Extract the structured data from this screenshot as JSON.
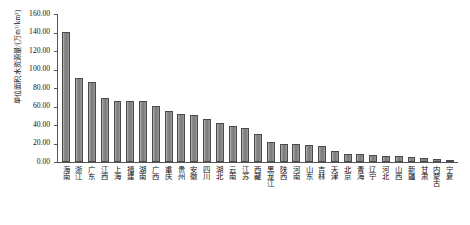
{
  "chart_data": {
    "type": "bar",
    "title": "",
    "xlabel": "",
    "ylabel": "单位面积水资源量/(万m³/km²)",
    "ylim": [
      0,
      160
    ],
    "ytick_step": 20,
    "ytick_labels": [
      "160.00",
      "140.00",
      "120.00",
      "100.00",
      "80.00",
      "60.00",
      "40.00",
      "20.00",
      "0.00"
    ],
    "grid": false,
    "legend": "none",
    "bar_color": "#8c8c8c",
    "bar_edge_color": "#4a4a4a",
    "axis_color": "#555555",
    "categories": [
      "海南",
      "浙江",
      "广东",
      "江西",
      "上海",
      "福建",
      "湖南",
      "广西",
      "重庆",
      "贵州",
      "安徽",
      "四川",
      "湖北",
      "云南",
      "江苏",
      "西藏",
      "黑龙江",
      "陕西",
      "河南",
      "山东",
      "吉林",
      "天津",
      "北京",
      "青海",
      "辽宁",
      "河北",
      "山西",
      "新疆",
      "甘肃",
      "内蒙古",
      "宁夏"
    ],
    "values": [
      141.0,
      91.0,
      86.0,
      69.0,
      66.0,
      66.0,
      66.0,
      61.0,
      55.0,
      52.0,
      51.0,
      47.0,
      42.0,
      39.0,
      37.0,
      30.0,
      22.0,
      20.0,
      19.0,
      18.0,
      17.0,
      12.0,
      9.0,
      8.5,
      8.0,
      7.0,
      6.0,
      5.0,
      4.0,
      3.0,
      1.5
    ]
  },
  "caption": ""
}
